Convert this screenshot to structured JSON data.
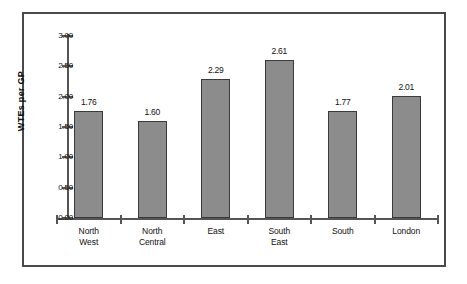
{
  "chart_data": {
    "type": "bar",
    "title": "",
    "xlabel": "",
    "ylabel": "WTEs per GP",
    "categories": [
      "North West",
      "North Central",
      "East",
      "South East",
      "South",
      "London"
    ],
    "category_lines": [
      [
        "North",
        "West"
      ],
      [
        "North",
        "Central"
      ],
      [
        "East"
      ],
      [
        "South",
        "East"
      ],
      [
        "South"
      ],
      [
        "London"
      ]
    ],
    "values": [
      1.76,
      1.6,
      2.29,
      2.61,
      1.77,
      2.01
    ],
    "value_labels": [
      "1.76",
      "1.60",
      "2.29",
      "2.61",
      "1.77",
      "2.01"
    ],
    "ylim": [
      0.0,
      3.0
    ],
    "ytick_labels": [
      "0.00",
      "0.50",
      "1.00",
      "1.50",
      "2.00",
      "2.50",
      "3.00"
    ],
    "ytick_values": [
      0.0,
      0.5,
      1.0,
      1.5,
      2.0,
      2.5,
      3.0
    ],
    "grid": false,
    "legend": false,
    "bar_color": "#8c8c8c",
    "bar_edge_color": "#3a3a3a",
    "axis_color": "#555555",
    "frame_color": "#4a4a4a",
    "background": "#ffffff"
  }
}
